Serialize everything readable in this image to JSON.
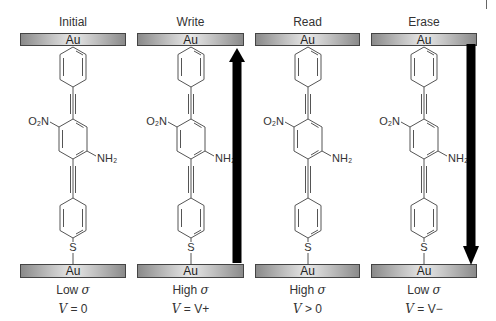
{
  "figure": {
    "electrode_label": "Au",
    "panels": [
      {
        "title": "Initial",
        "conductance_label": "Low",
        "sigma": "σ",
        "voltage_var": "V",
        "voltage_rel": " = 0",
        "arrow": "none"
      },
      {
        "title": "Write",
        "conductance_label": "High",
        "sigma": "σ",
        "voltage_var": "V",
        "voltage_rel": " = V+",
        "arrow": "up"
      },
      {
        "title": "Read",
        "conductance_label": "High",
        "sigma": "σ",
        "voltage_var": "V",
        "voltage_rel": " > 0",
        "arrow": "none"
      },
      {
        "title": "Erase",
        "conductance_label": "Low",
        "sigma": "σ",
        "voltage_var": "V",
        "voltage_rel": " = V−",
        "arrow": "down"
      }
    ],
    "molecule": {
      "nitro_group": "O₂N",
      "amino_group": "NH₂",
      "thiol_atom": "S"
    },
    "colors": {
      "electrode_dark": "#8a8a8a",
      "electrode_light": "#e8e8e8",
      "arrow": "#000000",
      "bond": "#555555"
    }
  }
}
